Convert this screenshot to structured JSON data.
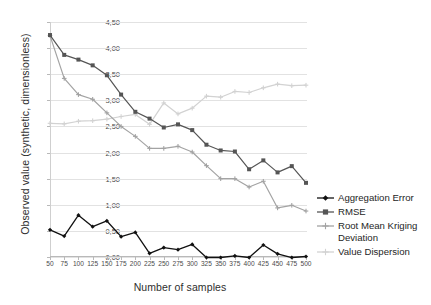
{
  "chart_data": {
    "type": "line",
    "title": "",
    "xlabel": "Number of samples",
    "ylabel": "Observed value (synthetic, dimensionless)",
    "x": [
      50,
      75,
      100,
      125,
      150,
      175,
      200,
      225,
      250,
      275,
      300,
      325,
      350,
      375,
      400,
      425,
      450,
      475,
      500
    ],
    "xticklabels": [
      "50",
      "75",
      "100",
      "125",
      "150",
      "175",
      "200",
      "225",
      "250",
      "275",
      "300",
      "325",
      "350",
      "375",
      "400",
      "425",
      "450",
      "475",
      "500"
    ],
    "yticklabels": [
      "0,00",
      "0,50",
      "1,00",
      "1,50",
      "2,00",
      "2,50",
      "3,00",
      "3,50",
      "4,00",
      "4,50"
    ],
    "ytickvalues": [
      0,
      0.5,
      1.0,
      1.5,
      2.0,
      2.5,
      3.0,
      3.5,
      4.0,
      4.5
    ],
    "ylim": [
      0,
      4.5
    ],
    "grid": "horizontal",
    "legend_position": "right",
    "series": [
      {
        "name": "Aggregation Error",
        "color": "#111111",
        "marker": "diamond",
        "values": [
          0.52,
          0.4,
          0.8,
          0.58,
          0.69,
          0.39,
          0.47,
          0.07,
          0.18,
          0.14,
          0.24,
          -0.01,
          -0.01,
          0.02,
          -0.01,
          0.23,
          0.06,
          -0.01,
          0.01
        ]
      },
      {
        "name": "RMSE",
        "color": "#555555",
        "marker": "square",
        "values": [
          4.25,
          3.87,
          3.78,
          3.67,
          3.48,
          3.11,
          2.78,
          2.65,
          2.48,
          2.54,
          2.43,
          2.15,
          2.04,
          2.02,
          1.68,
          1.85,
          1.62,
          1.74,
          1.42
        ]
      },
      {
        "name": "Root Mean Kriging Deviation",
        "color": "#a3a3a3",
        "marker": "plus",
        "values": [
          4.24,
          3.42,
          3.11,
          3.02,
          2.76,
          2.5,
          2.31,
          2.08,
          2.08,
          2.12,
          2.01,
          1.75,
          1.5,
          1.5,
          1.34,
          1.45,
          0.94,
          0.99,
          0.88
        ]
      },
      {
        "name": "Value Dispersion",
        "color": "#d2d2d2",
        "marker": "plus",
        "values": [
          2.56,
          2.55,
          2.6,
          2.61,
          2.64,
          2.69,
          2.73,
          2.54,
          2.95,
          2.74,
          2.85,
          3.08,
          3.06,
          3.17,
          3.15,
          3.24,
          3.31,
          3.28,
          3.29
        ]
      }
    ]
  }
}
